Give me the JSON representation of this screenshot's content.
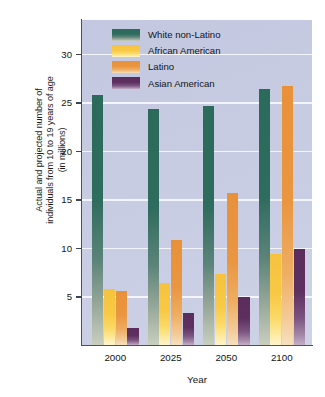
{
  "chart_data": {
    "type": "bar",
    "title": "",
    "xlabel": "Year",
    "ylabel": "Actual and projected number of individuals from 10 to 19 years of age (in millions)",
    "ylabel_lines": [
      "Actual and projected number of",
      "individuals from 10 to 19 years of age",
      "(in millions)"
    ],
    "categories": [
      "2000",
      "2025",
      "2050",
      "2100"
    ],
    "series": [
      {
        "name": "White non-Latino",
        "color": "#2c6a5c",
        "values": [
          25.8,
          24.3,
          24.6,
          26.4
        ]
      },
      {
        "name": "African American",
        "color": "#f6c23f",
        "values": [
          5.8,
          6.4,
          7.3,
          9.4
        ]
      },
      {
        "name": "Latino",
        "color": "#e8913a",
        "values": [
          5.6,
          10.8,
          15.7,
          26.7
        ]
      },
      {
        "name": "Asian American",
        "color": "#5a2d5c",
        "values": [
          1.8,
          3.3,
          5.0,
          9.9
        ]
      }
    ],
    "ylim": [
      0,
      33.5
    ],
    "yticks": [
      5,
      10,
      15,
      20,
      25,
      30
    ],
    "ytick_labels": [
      "5",
      "10",
      "15",
      "20",
      "25",
      "30"
    ],
    "grid": true,
    "grid_color": "#f4f5fa",
    "legend_position": "top-center",
    "plot_background": "#c6cbe2"
  }
}
